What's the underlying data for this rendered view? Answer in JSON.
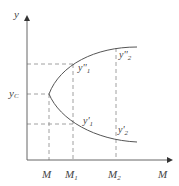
{
  "diagram": {
    "axes": {
      "y_label": "y",
      "x_label": "M"
    },
    "y_ticks": {
      "yc": {
        "main": "y",
        "sub": "C"
      }
    },
    "x_ticks": [
      {
        "main": "M",
        "sub": ""
      },
      {
        "main": "M",
        "sub": "1"
      },
      {
        "main": "M",
        "sub": "2"
      }
    ],
    "point_labels": {
      "y_double_prime_1": {
        "main": "y''",
        "sub": "1"
      },
      "y_double_prime_2": {
        "main": "y''",
        "sub": "2"
      },
      "y_prime_1": {
        "main": "y'",
        "sub": "1"
      },
      "y_prime_2": {
        "main": "y'",
        "sub": "2"
      }
    },
    "colors": {
      "axis": "#555555",
      "curve": "#555555",
      "dashed": "#888888",
      "text": "#444444"
    }
  }
}
